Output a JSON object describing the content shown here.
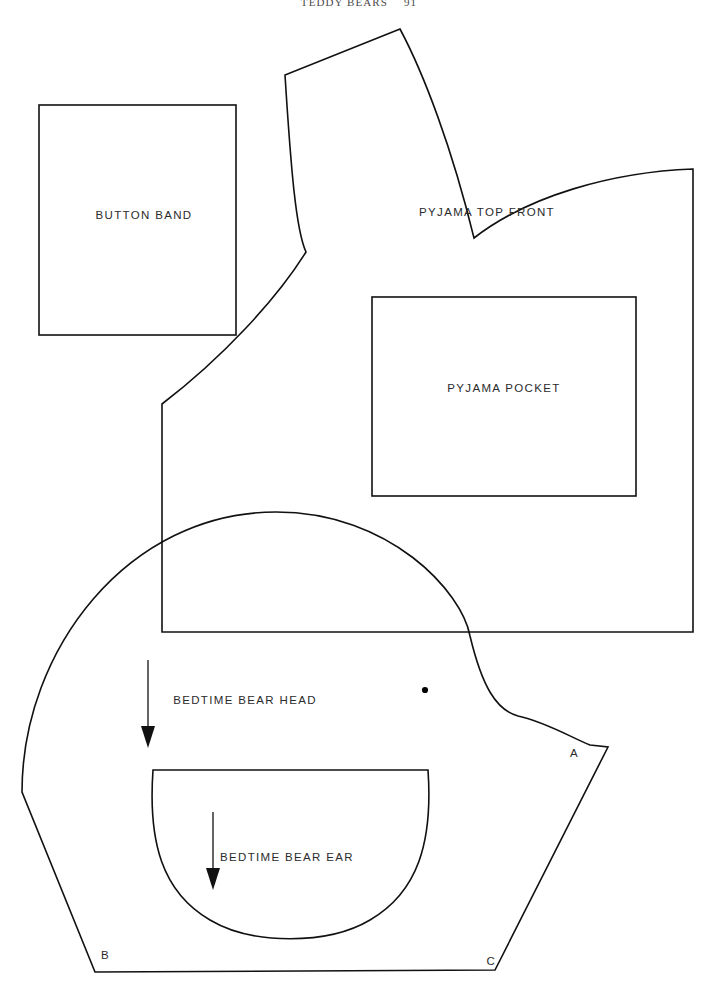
{
  "page": {
    "running_head": "TEDDY BEARS",
    "folio": "91",
    "width": 718,
    "height": 996,
    "background_color": "#ffffff",
    "ink_color": "#111111"
  },
  "pieces": [
    {
      "id": "button-band",
      "label": "BUTTON BAND",
      "shape": "rectangle",
      "label_x": 144,
      "label_y": 219,
      "rect": {
        "x": 39,
        "y": 105,
        "width": 197,
        "height": 230
      }
    },
    {
      "id": "pyjama-top-front",
      "label": "PYJAMA TOP FRONT",
      "shape": "outline",
      "label_x": 487,
      "label_y": 216,
      "path": "M 400 29 L 285 75 L 290 78 C 296 160 300 210 306 252 C 272 300 220 360 162 404 L 162 632 L 693 632 L 693 169 C 600 176 520 200 470 240 C 440 150 420 70 400 29 Z"
    },
    {
      "id": "pyjama-pocket",
      "label": "PYJAMA POCKET",
      "shape": "rectangle",
      "label_x": 504,
      "label_y": 392,
      "rect": {
        "x": 372,
        "y": 297,
        "width": 264,
        "height": 199
      }
    },
    {
      "id": "bedtime-bear-head",
      "label": "BEDTIME BEAR HEAD",
      "shape": "outline",
      "label_x": 245,
      "label_y": 704,
      "path": "M 95 972 L 22 790 C 22 660 130 512 278 512 C 398 512 470 600 472 640 C 486 690 498 712 520 718 C 548 724 572 740 592 745 L 608 745 L 495 970 Z"
    },
    {
      "id": "bedtime-bear-ear",
      "label": "BEDTIME BEAR EAR",
      "shape": "outline",
      "label_x": 287,
      "label_y": 861,
      "path": "M 153 770 L 428 770 C 432 840 420 890 372 920 C 330 946 252 946 210 920 C 162 890 150 840 153 770 Z"
    }
  ],
  "grain_lines": [
    {
      "id": "grain-line-head",
      "x": 148,
      "y_start": 660,
      "y_end": 742,
      "direction": "down"
    },
    {
      "id": "grain-line-ear",
      "x": 213,
      "y_start": 812,
      "y_end": 886,
      "direction": "down"
    }
  ],
  "markers": [
    {
      "id": "marker-a",
      "label": "A",
      "x": 574,
      "y": 757
    },
    {
      "id": "marker-b",
      "label": "B",
      "x": 105,
      "y": 959
    },
    {
      "id": "marker-c",
      "label": "C",
      "x": 491,
      "y": 965
    }
  ],
  "dots": [
    {
      "id": "placement-dot",
      "x": 425,
      "y": 690,
      "radius": 3.1
    }
  ]
}
